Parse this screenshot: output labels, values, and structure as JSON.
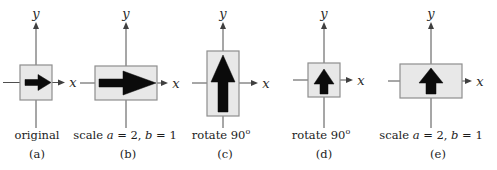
{
  "figure": {
    "description_colors": {
      "background": "#ffffff",
      "box_fill": "#e8e8e8",
      "box_border": "#8e8e8e",
      "arrow_color": "#0b0b0b",
      "axis_color": "#4f4f4f",
      "text_color": "#1c1c1c"
    },
    "panels": [
      {
        "tag": "(a)",
        "axis_x_label": "x",
        "axis_y_label": "y",
        "arrow_direction": "right",
        "box_shape": "square",
        "caption": {
          "pre": "original"
        }
      },
      {
        "tag": "(b)",
        "axis_x_label": "x",
        "axis_y_label": "y",
        "arrow_direction": "right",
        "box_shape": "wide-rectangle",
        "caption": {
          "pre": "scale ",
          "var1": "a",
          "mid": " = 2, ",
          "var2": "b",
          "post": " = 1"
        }
      },
      {
        "tag": "(c)",
        "axis_x_label": "x",
        "axis_y_label": "y",
        "arrow_direction": "up",
        "box_shape": "tall-rectangle",
        "caption": {
          "pre": "rotate 90",
          "sup": "o"
        }
      },
      {
        "tag": "(d)",
        "axis_x_label": "x",
        "axis_y_label": "y",
        "arrow_direction": "up",
        "box_shape": "square",
        "caption": {
          "pre": "rotate 90",
          "sup": "o"
        }
      },
      {
        "tag": "(e)",
        "axis_x_label": "x",
        "axis_y_label": "y",
        "arrow_direction": "up",
        "box_shape": "wide-rectangle",
        "caption": {
          "pre": "scale ",
          "var1": "a",
          "mid": " = 2, ",
          "var2": "b",
          "post": " = 1"
        }
      }
    ]
  }
}
